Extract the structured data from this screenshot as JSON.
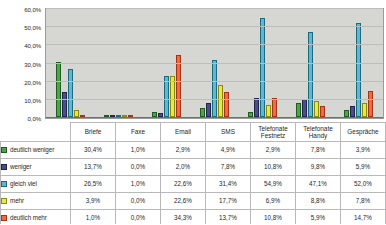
{
  "chart_data": {
    "type": "bar",
    "title": "",
    "xlabel": "",
    "ylabel": "",
    "ylim": [
      0,
      60
    ],
    "grid": true,
    "legend_position": "table-left",
    "ytick_labels": [
      "60,0%",
      "50,0%",
      "40,0%",
      "30,0%",
      "20,0%",
      "10,0%",
      "0,0%"
    ],
    "yticks": [
      60,
      50,
      40,
      30,
      20,
      10,
      0
    ],
    "categories": [
      "Briefe",
      "Faxe",
      "Email",
      "SMS",
      "Telefonate Festnetz",
      "Telefonate Handy",
      "Gespräche"
    ],
    "series": [
      {
        "name": "deutlich weniger",
        "color": "#4fa34f",
        "values": [
          30.4,
          1.0,
          2.9,
          4.9,
          2.9,
          7.8,
          3.9
        ],
        "labels": [
          "30,4%",
          "1,0%",
          "2,9%",
          "4,9%",
          "2,9%",
          "7,8%",
          "3,9%"
        ]
      },
      {
        "name": "weniger",
        "color": "#474f8a",
        "values": [
          13.7,
          0.0,
          2.0,
          7.8,
          10.8,
          9.8,
          5.9
        ],
        "labels": [
          "13,7%",
          "0,0%",
          "2,0%",
          "7,8%",
          "10,8%",
          "9,8%",
          "5,9%"
        ]
      },
      {
        "name": "gleich viel",
        "color": "#5fb8cf",
        "values": [
          26.5,
          1.0,
          22.6,
          31.4,
          54.9,
          47.1,
          52.0
        ],
        "labels": [
          "26,5%",
          "1,0%",
          "22,6%",
          "31,4%",
          "54,9%",
          "47,1%",
          "52,0%"
        ]
      },
      {
        "name": "mehr",
        "color": "#e8e84a",
        "values": [
          3.9,
          0.0,
          22.6,
          17.7,
          6.9,
          8.8,
          7.8
        ],
        "labels": [
          "3,9%",
          "0,0%",
          "22,6%",
          "17,7%",
          "6,9%",
          "8,8%",
          "7,8%"
        ]
      },
      {
        "name": "deutlich mehr",
        "color": "#ef6a45",
        "values": [
          1.0,
          0.0,
          34.3,
          13.7,
          10.8,
          5.9,
          14.7
        ],
        "labels": [
          "1,0%",
          "0,0%",
          "34,3%",
          "13,7%",
          "10,8%",
          "5,9%",
          "14,7%"
        ]
      }
    ]
  }
}
